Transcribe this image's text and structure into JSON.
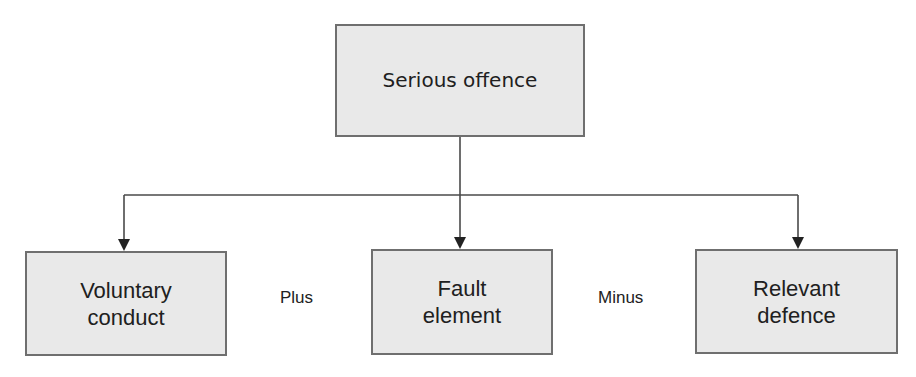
{
  "diagram": {
    "type": "hierarchy",
    "root": {
      "label": "Serious offence"
    },
    "children": [
      {
        "label": "Voluntary\nconduct"
      },
      {
        "label": "Fault\nelement"
      },
      {
        "label": "Relevant\ndefence"
      }
    ],
    "operators": [
      {
        "label": "Plus"
      },
      {
        "label": "Minus"
      }
    ],
    "edges": [
      {
        "from": "Serious offence",
        "to": "Voluntary conduct"
      },
      {
        "from": "Serious offence",
        "to": "Fault element"
      },
      {
        "from": "Serious offence",
        "to": "Relevant defence"
      }
    ],
    "colors": {
      "box_fill": "#e9e9e9",
      "box_border": "#6f6f6f",
      "line": "#4a4a4a",
      "text": "#202020"
    }
  }
}
